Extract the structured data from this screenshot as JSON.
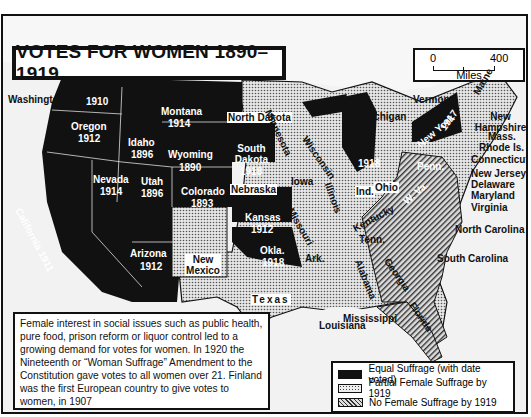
{
  "title": "VOTES FOR WOMEN 1890–1919",
  "scale": {
    "min": "0",
    "max": "400",
    "unit": "Miles"
  },
  "colors": {
    "equal": "#111111",
    "partial": "#bdbdbd",
    "none": "#8a8a8a",
    "ocean": "#f2f2f2",
    "canada": "#f4f4f4"
  },
  "states_equal": [
    {
      "name": "Washington",
      "year": "1910"
    },
    {
      "name": "Oregon",
      "year": "1912"
    },
    {
      "name": "California",
      "year": "1911",
      "label": "California 1911"
    },
    {
      "name": "Idaho",
      "year": "1896"
    },
    {
      "name": "Nevada",
      "year": "1914"
    },
    {
      "name": "Montana",
      "year": "1914"
    },
    {
      "name": "Wyoming",
      "year": "1890"
    },
    {
      "name": "Utah",
      "year": "1896"
    },
    {
      "name": "Colorado",
      "year": "1893"
    },
    {
      "name": "Arizona",
      "year": "1912"
    },
    {
      "name": "South Dakota",
      "year": "1918"
    },
    {
      "name": "Kansas",
      "year": "1912"
    },
    {
      "name": "Okla.",
      "year": "1918"
    },
    {
      "name": "Michigan",
      "year": "1918"
    },
    {
      "name": "New York",
      "year": "1917"
    }
  ],
  "states_partial": [
    "North Dakota",
    "Minnesota",
    "Wisconsin",
    "Iowa",
    "Nebraska",
    "Illinois",
    "Ind.",
    "Ohio",
    "Missouri",
    "Kentucky",
    "Tenn.",
    "Ark.",
    "New Mexico",
    "Texas",
    "Louisiana",
    "Mississippi",
    "Vermont",
    "Maine",
    "New Hampshire",
    "Mass.",
    "Rhode Is.",
    "Connecticut",
    "New Jersey",
    "Delaware",
    "Maryland"
  ],
  "states_none": [
    "Penn.",
    "W. Va.",
    "Virginia",
    "North Carolina",
    "South Carolina",
    "Georgia",
    "Alabama",
    "Florida"
  ],
  "labels": {
    "washington": "Washington",
    "wa_year": "1910",
    "oregon": "Oregon",
    "or_year": "1912",
    "california": "California 1911",
    "idaho": "Idaho",
    "id_year": "1896",
    "nevada": "Nevada",
    "nv_year": "1914",
    "montana": "Montana",
    "mt_year": "1914",
    "wyoming": "Wyoming",
    "wy_year": "1890",
    "utah": "Utah",
    "ut_year": "1896",
    "colorado": "Colorado",
    "co_year": "1893",
    "arizona": "Arizona",
    "az_year": "1912",
    "north_dakota": "North Dakota",
    "south_dakota": "South Dakota",
    "sd_year": "1918",
    "nebraska": "Nebraska",
    "kansas": "Kansas",
    "ks_year": "1912",
    "oklahoma": "Okla.",
    "ok_year": "1918",
    "new_mexico": "New Mexico",
    "texas": "Texas",
    "minnesota": "Minnesota",
    "iowa": "Iowa",
    "missouri": "Missouri",
    "arkansas": "Ark.",
    "louisiana": "Louisiana",
    "wisconsin": "Wisconsin",
    "illinois": "Illinois",
    "michigan": "Michigan",
    "mi_year": "1918",
    "indiana": "Ind.",
    "ohio": "Ohio",
    "kentucky": "Kentucky",
    "tennessee": "Tenn.",
    "mississippi": "Mississippi",
    "alabama": "Alabama",
    "georgia": "Georgia",
    "florida": "Florida",
    "south_carolina": "South Carolina",
    "north_carolina": "North Carolina",
    "virginia": "Virginia",
    "west_virginia": "W. Va.",
    "maryland": "Maryland",
    "delaware": "Delaware",
    "new_jersey": "New Jersey",
    "pennsylvania": "Penn.",
    "new_york": "New York",
    "ny_year": "1917",
    "connecticut": "Connecticut",
    "rhode_island": "Rhode Is.",
    "massachusetts": "Mass.",
    "new_hampshire": "New Hampshire",
    "vermont": "Vermont",
    "maine": "Maine"
  },
  "info_text": "Female interest in social issues such as public health, pure food, prison reform or liquor control led to a growing demand for votes for women. In 1920 the Nineteenth or “Woman Suffrage” Amendment to the Constitution gave votes to all women over 21. Finland was the first European country to give votes to women, in 1907",
  "legend": [
    {
      "key": "equal",
      "label": "Equal Suffrage (with date voted)"
    },
    {
      "key": "partial",
      "label": "Partial Female Suffrage by 1919"
    },
    {
      "key": "none",
      "label": "No Female Suffrage by 1919"
    }
  ]
}
